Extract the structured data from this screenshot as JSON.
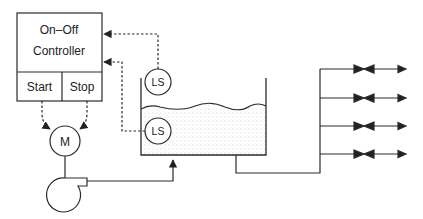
{
  "controller": {
    "title_line1": "On–Off",
    "title_line2": "Controller",
    "start_label": "Start",
    "stop_label": "Stop"
  },
  "motor": {
    "label": "M"
  },
  "level_switches": {
    "upper": {
      "label": "LS"
    },
    "lower": {
      "label": "LS"
    }
  },
  "distribution": {
    "branch_count": 4
  },
  "colors": {
    "line": "#2a2a2a",
    "liquid_dots": "#9a9a9a",
    "background": "#ffffff"
  }
}
